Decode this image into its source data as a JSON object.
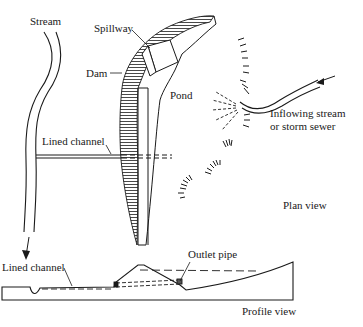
{
  "labels": {
    "stream": "Stream",
    "spillway": "Spillway",
    "dam": "Dam",
    "pond": "Pond",
    "inflow_line1": "Inflowing stream",
    "inflow_line2": "or storm sewer",
    "lined_channel_plan": "Lined channel",
    "plan_view": "Plan view",
    "lined_channel_profile": "Lined channel",
    "outlet_pipe": "Outlet pipe",
    "profile_view": "Profile view"
  },
  "colors": {
    "ink": "#1a1a1a",
    "background": "#ffffff"
  }
}
